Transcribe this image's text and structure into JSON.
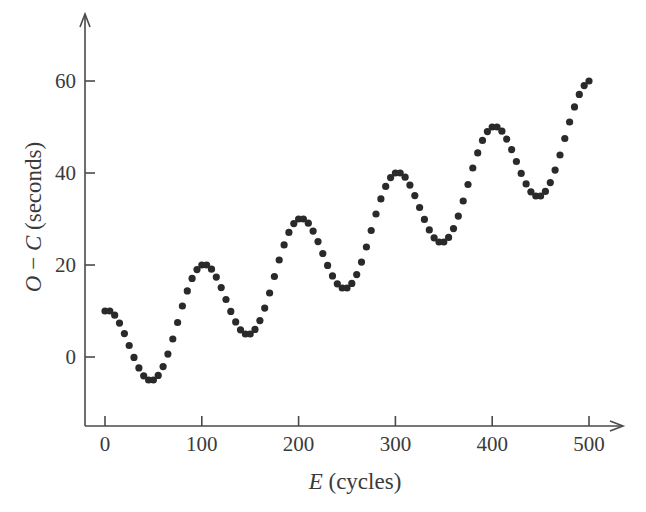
{
  "chart_data": {
    "type": "scatter",
    "title": "",
    "xlabel_italic": "E",
    "xlabel_rest": " (cycles)",
    "xlabel": "E (cycles)",
    "ylabel_italic_1": "O",
    "ylabel_sep": " − ",
    "ylabel_italic_2": "C",
    "ylabel_rest": " (seconds)",
    "ylabel": "O − C (seconds)",
    "xlim": [
      -5,
      535
    ],
    "ylim": [
      -15,
      74
    ],
    "xticks": [
      0,
      100,
      200,
      300,
      400,
      500
    ],
    "yticks": [
      0,
      20,
      40,
      60
    ],
    "grid": false,
    "legend": null,
    "marker_color": "#2a2a2a",
    "axis_color": "#4a4a4a",
    "series": [
      {
        "name": "O-C",
        "x": [
          0,
          5,
          10,
          15,
          20,
          25,
          30,
          35,
          40,
          45,
          50,
          55,
          60,
          65,
          70,
          75,
          80,
          85,
          90,
          95,
          100,
          105,
          110,
          115,
          120,
          125,
          130,
          135,
          140,
          145,
          150,
          155,
          160,
          165,
          170,
          175,
          180,
          185,
          190,
          195,
          200,
          205,
          210,
          215,
          220,
          225,
          230,
          235,
          240,
          245,
          250,
          255,
          260,
          265,
          270,
          275,
          280,
          285,
          290,
          295,
          300,
          305,
          310,
          315,
          320,
          325,
          330,
          335,
          340,
          345,
          350,
          355,
          360,
          365,
          370,
          375,
          380,
          385,
          390,
          395,
          400,
          405,
          410,
          415,
          420,
          425,
          430,
          435,
          440,
          445,
          450,
          455,
          460,
          465,
          470,
          475,
          480,
          485,
          490,
          495,
          500
        ],
        "y": [
          10.0,
          10.01,
          9.09,
          7.38,
          5.09,
          2.5,
          -0.09,
          -2.38,
          -4.09,
          -5.01,
          -5.0,
          -4.01,
          -2.09,
          0.62,
          3.91,
          7.5,
          11.09,
          14.38,
          17.09,
          18.99,
          20.0,
          20.01,
          19.09,
          17.38,
          15.09,
          12.5,
          9.91,
          7.62,
          5.91,
          4.99,
          5.0,
          5.99,
          7.91,
          10.62,
          13.91,
          17.5,
          21.09,
          24.38,
          27.09,
          28.99,
          30.0,
          30.01,
          29.09,
          27.38,
          25.09,
          22.5,
          19.91,
          17.62,
          15.91,
          14.99,
          15.0,
          15.99,
          17.91,
          20.62,
          23.91,
          27.5,
          31.09,
          34.38,
          37.09,
          38.99,
          40.0,
          40.01,
          39.09,
          37.38,
          35.09,
          32.5,
          29.91,
          27.62,
          25.91,
          24.99,
          25.0,
          25.99,
          27.91,
          30.62,
          33.91,
          37.5,
          41.09,
          44.38,
          47.09,
          48.99,
          50.0,
          50.01,
          49.09,
          47.38,
          45.09,
          42.5,
          39.91,
          37.62,
          35.91,
          34.99,
          35.0,
          35.99,
          37.91,
          40.62,
          43.91,
          47.5,
          51.09,
          54.38,
          57.09,
          58.99,
          60.0
        ]
      }
    ]
  }
}
